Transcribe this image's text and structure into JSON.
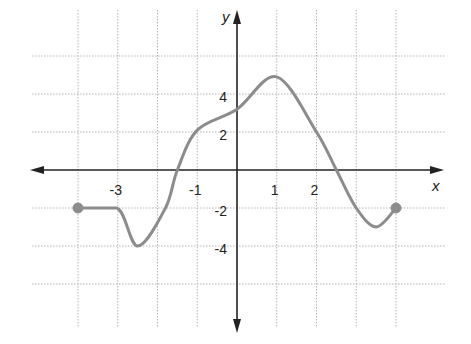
{
  "chart_data": {
    "type": "line",
    "title": "",
    "xlabel": "x",
    "ylabel": "y",
    "xlim": [
      -5,
      5.2
    ],
    "ylim": [
      -8,
      8.3
    ],
    "grid": true,
    "grid_x_step": 1,
    "grid_y_step": 2,
    "x_tick_labels": [
      {
        "value": -3,
        "label": "-3"
      },
      {
        "value": -1,
        "label": "-1"
      },
      {
        "value": 1,
        "label": "1"
      },
      {
        "value": 2,
        "label": "2"
      }
    ],
    "y_tick_labels": [
      {
        "value": 4,
        "label": "4"
      },
      {
        "value": 2,
        "label": "2"
      },
      {
        "value": -2,
        "label": "-2"
      },
      {
        "value": -4,
        "label": "-4"
      }
    ],
    "series": [
      {
        "name": "f(x)",
        "color": "#8c8c8c",
        "x": [
          -4,
          -3.05,
          -2.5,
          -1.8,
          -1.5,
          -1,
          0,
          1,
          2,
          2.5,
          3,
          3.5,
          4
        ],
        "y": [
          -2,
          -2,
          -4,
          -2,
          0,
          2.1,
          3.2,
          4.9,
          2,
          0,
          -2,
          -3,
          -2
        ],
        "endpoints": [
          {
            "x": -4,
            "y": -2,
            "closed": true
          },
          {
            "x": 4,
            "y": -2,
            "closed": true
          }
        ]
      }
    ]
  },
  "colors": {
    "axis": "#222222",
    "grid": "#b5b5b5",
    "curve": "#8c8c8c",
    "endpoint": "#8c8c8c"
  }
}
